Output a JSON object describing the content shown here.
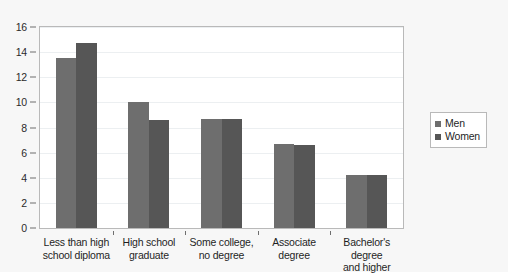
{
  "chart_data": {
    "type": "bar",
    "title": "",
    "subtitle": "",
    "xlabel": "",
    "ylabel": "",
    "ylim": [
      0,
      16
    ],
    "yticks": [
      0,
      2,
      4,
      6,
      8,
      10,
      12,
      14,
      16
    ],
    "ytick_labels": [
      "0",
      "2",
      "4",
      "6",
      "8",
      "10",
      "12",
      "14",
      "16"
    ],
    "grid": true,
    "legend_position": "right",
    "categories": [
      "Less than high school diploma",
      "High school graduate",
      "Some college, no degree",
      "Associate degree",
      "Bachelor's degree and higher"
    ],
    "category_lines": [
      [
        "Less than high",
        "school diploma"
      ],
      [
        "High school",
        "graduate"
      ],
      [
        "Some college,",
        "no degree"
      ],
      [
        "Associate",
        "degree"
      ],
      [
        "Bachelor's degree",
        "and higher"
      ]
    ],
    "series": [
      {
        "name": "Men",
        "color": "#6e6e6e",
        "values": [
          13.5,
          10.0,
          8.7,
          6.7,
          4.2
        ]
      },
      {
        "name": "Women",
        "color": "#565656",
        "values": [
          14.7,
          8.6,
          8.7,
          6.6,
          4.2
        ]
      }
    ]
  },
  "legend": {
    "items": [
      {
        "label": "Men"
      },
      {
        "label": "Women"
      }
    ]
  },
  "colors": {
    "men": "#6e6e6e",
    "women": "#565656",
    "canvas": "#f7f7f7",
    "plot_background": "#ffffff",
    "axis": "#b9b9b9",
    "gridline": "#eceff1",
    "text": "#1f1f1f"
  }
}
